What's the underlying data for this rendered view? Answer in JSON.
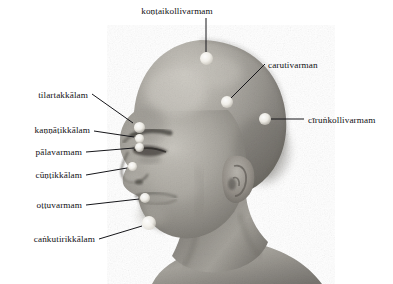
{
  "figure": {
    "rendering": "grayscale halftone photograph",
    "background_color": "#ffffff",
    "line_color": "#16161a",
    "marker_color": "#f3f1ea",
    "skin_light": "#bcb9b2",
    "skin_mid": "#8d8a84",
    "skin_dark": "#55524d"
  },
  "labels": [
    {
      "id": "kontaikollivarmam",
      "text": "koṇṭaikollivarmam",
      "side": "top",
      "text_x": 177,
      "text_y": 13,
      "anchor": "middle",
      "leader": {
        "x1": 206,
        "y1": 18,
        "x2": 206,
        "y2": 52
      },
      "marker": {
        "x": 206,
        "y": 58,
        "r": 6.5
      }
    },
    {
      "id": "carutivarman",
      "text": "carutivarman",
      "side": "right",
      "text_x": 268,
      "text_y": 67,
      "anchor": "start",
      "leader": {
        "x1": 265,
        "y1": 64,
        "x2": 231,
        "y2": 98
      },
      "marker": {
        "x": 227,
        "y": 102,
        "r": 6.0
      }
    },
    {
      "id": "cirunkollivarmam",
      "text": "cīruṅkollivarmam",
      "side": "right",
      "text_x": 308,
      "text_y": 122,
      "anchor": "start",
      "leader": {
        "x1": 304,
        "y1": 119,
        "x2": 271,
        "y2": 119
      },
      "marker": {
        "x": 265,
        "y": 119,
        "r": 6.0
      }
    },
    {
      "id": "tilartakkalam",
      "text": "tilartakkālam",
      "side": "left",
      "text_x": 88,
      "text_y": 97,
      "anchor": "end",
      "leader": {
        "x1": 92,
        "y1": 94,
        "x2": 133,
        "y2": 123
      },
      "marker": {
        "x": 139,
        "y": 127,
        "r": 5.5
      }
    },
    {
      "id": "kannatikkalam",
      "text": "kaṇṇāṭikkālam",
      "side": "left",
      "text_x": 90,
      "text_y": 132,
      "anchor": "end",
      "leader": {
        "x1": 94,
        "y1": 131,
        "x2": 134,
        "y2": 137
      },
      "marker": {
        "x": 139,
        "y": 138,
        "r": 4.5
      }
    },
    {
      "id": "palavarmam",
      "text": "pālavarmam",
      "side": "left",
      "text_x": 82,
      "text_y": 154,
      "anchor": "end",
      "leader": {
        "x1": 86,
        "y1": 152,
        "x2": 134,
        "y2": 148
      },
      "marker": {
        "x": 139,
        "y": 147,
        "r": 4.5
      }
    },
    {
      "id": "cuntikkalam",
      "text": "cūṇṭikkālam",
      "side": "left",
      "text_x": 82,
      "text_y": 177,
      "anchor": "end",
      "leader": {
        "x1": 86,
        "y1": 175,
        "x2": 127,
        "y2": 168
      },
      "marker": {
        "x": 132,
        "y": 166,
        "r": 4.5
      }
    },
    {
      "id": "ottuvarmam",
      "text": "oṭṭuvarmam",
      "side": "left",
      "text_x": 82,
      "text_y": 207,
      "anchor": "end",
      "leader": {
        "x1": 86,
        "y1": 205,
        "x2": 139,
        "y2": 199
      },
      "marker": {
        "x": 145,
        "y": 198,
        "r": 5.0
      }
    },
    {
      "id": "cankutirikkalam",
      "text": "caṅkutirikkālam",
      "side": "left",
      "text_x": 95,
      "text_y": 241,
      "anchor": "end",
      "leader": {
        "x1": 99,
        "y1": 239,
        "x2": 142,
        "y2": 226
      },
      "marker": {
        "x": 149,
        "y": 223,
        "r": 7.0
      }
    }
  ]
}
